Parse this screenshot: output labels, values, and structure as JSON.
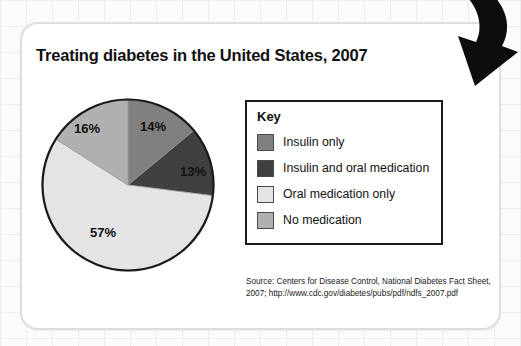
{
  "card": {
    "title": "Treating diabetes in the United States, 2007"
  },
  "legend": {
    "title": "Key",
    "items": [
      {
        "label": "Insulin only",
        "color": "#808080"
      },
      {
        "label": "Insulin and oral medication",
        "color": "#404040"
      },
      {
        "label": "Oral medication only",
        "color": "#e4e4e4"
      },
      {
        "label": "No medication",
        "color": "#b0b0b0"
      }
    ]
  },
  "source": {
    "line1": "Source: Centers for Disease Control, National Diabetes Fact Sheet,",
    "line2": "2007; http://www.cdc.gov/diabetes/pubs/pdf/ndfs_2007.pdf"
  },
  "decor": {
    "arrow_icon": "curved-down-left-arrow"
  },
  "chart_data": {
    "type": "pie",
    "title": "Treating diabetes in the United States, 2007",
    "categories": [
      "Insulin only",
      "Insulin and oral medication",
      "Oral medication only",
      "No medication"
    ],
    "values": [
      14,
      13,
      57,
      16
    ],
    "labels": [
      "14%",
      "13%",
      "57%",
      "16%"
    ],
    "colors": [
      "#808080",
      "#404040",
      "#e4e4e4",
      "#b0b0b0"
    ],
    "unit": "percent",
    "legend_position": "right",
    "grid": false,
    "start_angle_deg": 0,
    "direction": "clockwise",
    "source": "Centers for Disease Control, National Diabetes Fact Sheet, 2007; http://www.cdc.gov/diabetes/pubs/pdf/ndfs_2007.pdf"
  }
}
